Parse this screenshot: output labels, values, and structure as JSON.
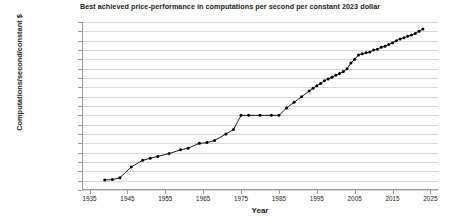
{
  "chart_data": {
    "type": "line",
    "title": "Best achieved price-performance in computations per second per constant 2023 dollar",
    "xlabel": "Year",
    "ylabel": "Computations/second/constant $",
    "grid": true,
    "legend": false,
    "log_y": true,
    "xlim": [
      1933,
      2027
    ],
    "ylim": [
      1e-06,
      1000000000000.0
    ],
    "xticks": [
      1935,
      1945,
      1955,
      1965,
      1975,
      1985,
      1995,
      2005,
      2015,
      2025
    ],
    "xtick_labels": [
      "1935",
      "1945",
      "1955",
      "1965",
      "1975",
      "1985",
      "1995",
      "2005",
      "2015",
      "2025"
    ],
    "yticks": [
      1000000000000.0,
      100000000000.0,
      10000000000.0,
      1000000000.0,
      100000000.0,
      10000000.0,
      1000000.0,
      100000.0,
      10000.0,
      1000.0,
      100,
      10,
      1,
      0.1,
      0.01,
      0.001,
      0.0001,
      1e-05,
      1e-06
    ],
    "ytick_labels": [
      "1,000,000,000,000",
      "100,000,000,000",
      "10,000,000,000",
      "1,000,000,000",
      "100,000,000",
      "10,000,000",
      "1,000,000",
      "100,000",
      "10,000",
      "1,000",
      "100",
      "10",
      "1.0",
      "0.1",
      "0.01",
      "0.001",
      "0.0001",
      "0.00001",
      "0.000001"
    ],
    "marker_color": "#000000",
    "line_color": "#000000",
    "grid_color": "#d8d8d8",
    "axis_color": "#9a9a9a",
    "series": [
      {
        "name": "Best achieved price-performance",
        "x": [
          1939,
          1941,
          1943,
          1946,
          1949,
          1951,
          1953,
          1956,
          1959,
          1961,
          1964,
          1966,
          1968,
          1971,
          1973,
          1975,
          1977,
          1980,
          1983,
          1985,
          1987,
          1989,
          1991,
          1993,
          1994,
          1995,
          1996,
          1997,
          1998,
          1999,
          2000,
          2001,
          2002,
          2003,
          2004,
          2005,
          2006,
          2007,
          2008,
          2009,
          2010,
          2011,
          2012,
          2013,
          2014,
          2015,
          2016,
          2017,
          2018,
          2019,
          2020,
          2021,
          2022,
          2023
        ],
        "y": [
          1.2e-05,
          1.3e-05,
          2e-05,
          0.0003,
          0.0015,
          0.0025,
          0.004,
          0.008,
          0.02,
          0.03,
          0.1,
          0.12,
          0.2,
          1.0,
          3.0,
          100.0,
          100.0,
          100.0,
          100.0,
          100.0,
          600.0,
          2500.0,
          10000.0,
          40000.0,
          80000.0,
          150000.0,
          250000.0,
          500000.0,
          800000.0,
          1200000.0,
          2000000.0,
          3000000.0,
          5000000.0,
          10000000.0,
          40000000.0,
          100000000.0,
          300000000.0,
          400000000.0,
          500000000.0,
          600000000.0,
          1000000000.0,
          1200000000.0,
          2000000000.0,
          2500000000.0,
          4000000000.0,
          6000000000.0,
          10000000000.0,
          15000000000.0,
          20000000000.0,
          30000000000.0,
          40000000000.0,
          60000000000.0,
          100000000000.0,
          180000000000.0
        ]
      }
    ]
  }
}
